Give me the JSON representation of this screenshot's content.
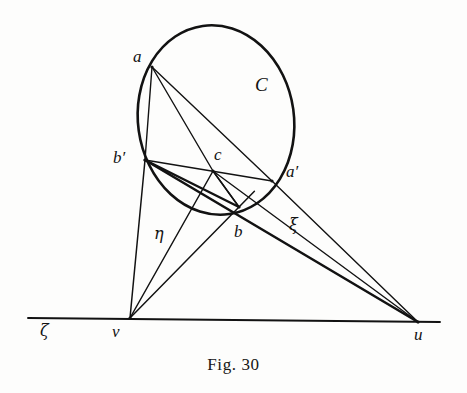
{
  "figure": {
    "caption": "Fig. 30",
    "curve_label": "C",
    "points": [
      {
        "id": "a",
        "label": "a",
        "x": 152,
        "y": 67,
        "label_x": 133,
        "label_y": 48
      },
      {
        "id": "b_prime",
        "label": "b′",
        "x": 145,
        "y": 160,
        "label_x": 113,
        "label_y": 149
      },
      {
        "id": "c",
        "label": "c",
        "x": 213,
        "y": 171,
        "label_x": 214,
        "label_y": 146
      },
      {
        "id": "a_prime",
        "label": "a′",
        "x": 272,
        "y": 181,
        "label_x": 286,
        "label_y": 163
      },
      {
        "id": "b",
        "label": "b",
        "x": 239,
        "y": 207,
        "label_x": 234,
        "label_y": 223
      },
      {
        "id": "v",
        "label": "v",
        "x": 130,
        "y": 318,
        "label_x": 112,
        "label_y": 323
      },
      {
        "id": "u",
        "label": "u",
        "x": 418,
        "y": 322,
        "label_x": 414,
        "label_y": 326
      }
    ],
    "line_labels": [
      {
        "id": "eta",
        "label": "η",
        "x": 154,
        "y": 226
      },
      {
        "id": "xi",
        "label": "ξ",
        "x": 289,
        "y": 217
      },
      {
        "id": "zeta",
        "label": "ζ",
        "x": 40,
        "y": 323
      }
    ],
    "curve": {
      "type": "ellipse",
      "cx": 216,
      "cy": 120,
      "rx": 78,
      "ry": 95,
      "rotation": -8,
      "label_x": 255,
      "label_y": 75
    },
    "baseline": {
      "x1": 28,
      "y1": 318,
      "x2": 440,
      "y2": 322
    },
    "chords": [
      {
        "from": "a",
        "to": "b_prime"
      },
      {
        "from": "a",
        "to": "c"
      },
      {
        "from": "a",
        "to": "a_prime"
      },
      {
        "from": "b_prime",
        "to": "a_prime"
      },
      {
        "from": "b_prime",
        "to": "b"
      },
      {
        "from": "c",
        "to": "b"
      }
    ],
    "rays_from_v": [
      {
        "to": "b_prime"
      },
      {
        "to": "c"
      },
      {
        "to": "b"
      }
    ],
    "rays_to_u": [
      {
        "from": "b_prime"
      },
      {
        "from": "c"
      },
      {
        "from": "a_prime"
      }
    ],
    "colors": {
      "ink": "#121212",
      "paper": "#fdfdfc"
    }
  }
}
